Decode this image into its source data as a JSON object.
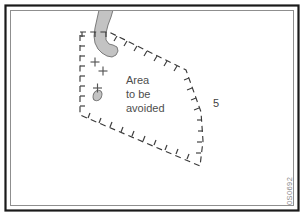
{
  "figure": {
    "background_color": "#ffffff",
    "frame": {
      "outer_color": "#1a1a1a",
      "inner_color": "#9a9a9a"
    },
    "label_area_avoided": {
      "line1": "Area",
      "line2": "to be",
      "line3": "avoided",
      "color": "#4d4d4d"
    },
    "depth_label": {
      "value": "5",
      "color": "#3f3f3f"
    },
    "reference_code": {
      "value": "0S0692",
      "color": "#8a8a8a"
    },
    "landmass": {
      "name": "peninsula",
      "fill_color": "#c3c3c3",
      "stroke_color": "#6e6e6e"
    },
    "islet": {
      "name": "islet",
      "fill_color": "#c3c3c3",
      "stroke_color": "#6e6e6e"
    },
    "boundary": {
      "name": "area-to-be-avoided-boundary",
      "style": "dashed-with-inward-ticks",
      "color": "#3a3a3a"
    },
    "rock_marks": {
      "symbol": "cross",
      "count": 3,
      "color": "#555555"
    }
  }
}
